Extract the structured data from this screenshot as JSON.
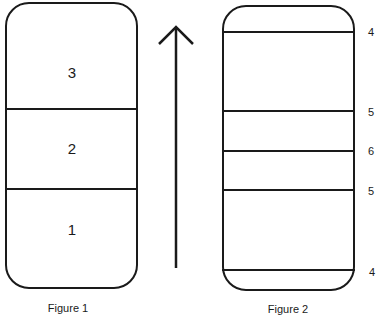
{
  "figure1": {
    "caption": "Figure 1",
    "segments": [
      {
        "label": "3"
      },
      {
        "label": "2"
      },
      {
        "label": "1"
      }
    ]
  },
  "arrow": {
    "direction": "up",
    "icon": "arrow-up-icon"
  },
  "figure2": {
    "caption": "Figure 2",
    "line_labels": [
      "4",
      "5",
      "6",
      "5",
      "4"
    ]
  }
}
